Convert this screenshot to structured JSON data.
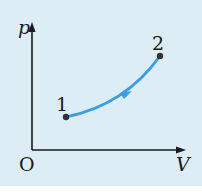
{
  "diagram": {
    "type": "p-V diagram",
    "axes": {
      "y_label": "p",
      "x_label": "V",
      "origin_label": "O"
    },
    "points": [
      {
        "label": "1",
        "x": 66,
        "y": 117
      },
      {
        "label": "2",
        "x": 160,
        "y": 56
      }
    ],
    "process": {
      "from": "1",
      "to": "2",
      "direction_arrow": true,
      "shape": "concave-up curve"
    },
    "colors": {
      "background": "#dcedf5",
      "curve": "#3a9ee0",
      "axes": "#1a1a1a",
      "points": "#333333"
    }
  }
}
